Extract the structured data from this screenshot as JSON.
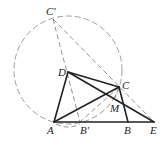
{
  "diagram": {
    "type": "geometry",
    "points": {
      "A": {
        "label": "A",
        "x": 54,
        "y": 122
      },
      "B": {
        "label": "B",
        "x": 128,
        "y": 122
      },
      "B_prime": {
        "label": "B'",
        "x": 80,
        "y": 122
      },
      "C": {
        "label": "C",
        "x": 119,
        "y": 87
      },
      "C_prime": {
        "label": "C'",
        "x": 53,
        "y": 19
      },
      "D": {
        "label": "D",
        "x": 68,
        "y": 72
      },
      "E": {
        "label": "E",
        "x": 154,
        "y": 122
      },
      "M": {
        "label": "M",
        "x": 117,
        "y": 103
      }
    },
    "circle": {
      "cx": 68,
      "cy": 70,
      "r": 54,
      "style": "dashed"
    },
    "solid_segments": [
      "AD",
      "DC",
      "CB",
      "AE",
      "AC",
      "DE"
    ],
    "dashed_segments": [
      "C'B'",
      "C'E",
      "CB'",
      "CM"
    ]
  }
}
